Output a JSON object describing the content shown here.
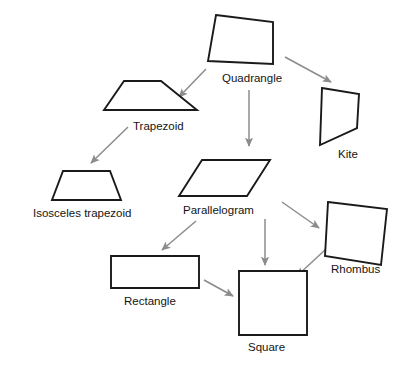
{
  "diagram": {
    "background_color": "#ffffff",
    "shape_stroke_color": "#1a1a1a",
    "arrow_color": "#8c8c8c",
    "label_color": "#141414",
    "nodes": [
      {
        "id": "quadrangle",
        "label": "Quadrangle",
        "shape": "irregular-quadrilateral",
        "label_x": 222,
        "label_y": 79,
        "label_anchor": "start",
        "points": "216,15 273,22 273,64 208,61"
      },
      {
        "id": "trapezoid",
        "label": "Trapezoid",
        "shape": "right-trapezoid",
        "label_x": 133,
        "label_y": 127,
        "label_anchor": "start",
        "points": "124,81 161,81 197,110 104,110"
      },
      {
        "id": "kite",
        "label": "Kite",
        "shape": "kite",
        "label_x": 338,
        "label_y": 155,
        "label_anchor": "start",
        "points": "322,88 359,94 357,128 320,145"
      },
      {
        "id": "isosceles-trapezoid",
        "label": "Isosceles trapezoid",
        "shape": "isosceles-trapezoid",
        "label_x": 33,
        "label_y": 214,
        "label_anchor": "start",
        "points": "63,171 110,171 121,200 52,200"
      },
      {
        "id": "parallelogram",
        "label": "Parallelogram",
        "shape": "parallelogram",
        "label_x": 183,
        "label_y": 211,
        "label_anchor": "start",
        "points": "202,160 270,160 247,196 179,196"
      },
      {
        "id": "rhombus",
        "label": "Rhombus",
        "shape": "rhombus",
        "label_x": 331,
        "label_y": 270,
        "label_anchor": "start",
        "points": "328,202 387,209 381,265 325,256"
      },
      {
        "id": "rectangle",
        "label": "Rectangle",
        "shape": "rectangle",
        "label_x": 124,
        "label_y": 302,
        "label_anchor": "start",
        "points": "111,256 199,256 199,288 111,288"
      },
      {
        "id": "square",
        "label": "Square",
        "shape": "square",
        "label_x": 248,
        "label_y": 348,
        "label_anchor": "start",
        "points": "239,271 307,271 307,335 239,335"
      }
    ],
    "edges": [
      {
        "id": "quadrangle-to-trapezoid",
        "from": "quadrangle",
        "to": "trapezoid",
        "x1": 206,
        "y1": 69,
        "x2": 179,
        "y2": 97
      },
      {
        "id": "quadrangle-to-parallelogram",
        "from": "quadrangle",
        "to": "parallelogram",
        "x1": 249,
        "y1": 90,
        "x2": 249,
        "y2": 146
      },
      {
        "id": "quadrangle-to-kite",
        "from": "quadrangle",
        "to": "kite",
        "x1": 285,
        "y1": 57,
        "x2": 331,
        "y2": 82
      },
      {
        "id": "trapezoid-to-isosceles-trapezoid",
        "from": "trapezoid",
        "to": "isosceles-trapezoid",
        "x1": 128,
        "y1": 127,
        "x2": 91,
        "y2": 163
      },
      {
        "id": "parallelogram-to-rectangle",
        "from": "parallelogram",
        "to": "rectangle",
        "x1": 196,
        "y1": 221,
        "x2": 162,
        "y2": 250
      },
      {
        "id": "parallelogram-to-square",
        "from": "parallelogram",
        "to": "square",
        "x1": 265,
        "y1": 219,
        "x2": 265,
        "y2": 265
      },
      {
        "id": "parallelogram-to-rhombus",
        "from": "parallelogram",
        "to": "rhombus",
        "x1": 282,
        "y1": 202,
        "x2": 319,
        "y2": 228
      },
      {
        "id": "rectangle-to-square",
        "from": "rectangle",
        "to": "square",
        "x1": 204,
        "y1": 280,
        "x2": 233,
        "y2": 296
      },
      {
        "id": "rhombus-to-square",
        "from": "rhombus",
        "to": "square",
        "x1": 326,
        "y1": 249,
        "x2": 297,
        "y2": 276
      }
    ]
  }
}
